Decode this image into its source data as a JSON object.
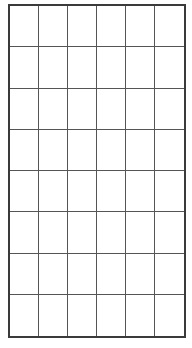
{
  "grid": {
    "rows": 8,
    "columns": 6,
    "line_color": "#555555",
    "border_color": "#3a3a3a",
    "background": "#ffffff"
  }
}
